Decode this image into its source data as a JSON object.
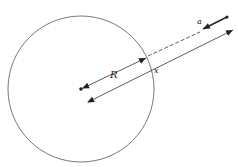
{
  "diagram": {
    "type": "physics-geometry",
    "labels": {
      "radius": "R",
      "distance": "x",
      "acceleration": "a"
    },
    "colors": {
      "stroke": "#333333",
      "circle": "#555555",
      "background": "#ffffff"
    }
  }
}
